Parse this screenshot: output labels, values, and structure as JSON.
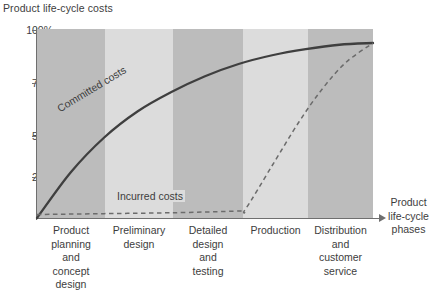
{
  "chart_data": {
    "type": "line",
    "title": "Product life-cycle costs",
    "xlabel": "Product life-cycle phases",
    "ylabel": "",
    "grid": false,
    "legend_position": "inline-annotations",
    "ylim": [
      0,
      108
    ],
    "ytick_labels": [
      "100%",
      "75%",
      "50%",
      "25%"
    ],
    "ytick_values": [
      100,
      75,
      50,
      25
    ],
    "categories": [
      "Product planning and concept design",
      "Preliminary design",
      "Detailed design and testing",
      "Production",
      "Distribution and customer service"
    ],
    "category_lines": [
      [
        "Product",
        "planning",
        "and",
        "concept",
        "design"
      ],
      [
        "Preliminary",
        "design"
      ],
      [
        "Detailed",
        "design",
        "and",
        "testing"
      ],
      [
        "Production"
      ],
      [
        "Distribution",
        "and",
        "customer",
        "service"
      ]
    ],
    "series": [
      {
        "name": "Committed costs",
        "style": "solid",
        "color": "#3f3f3f",
        "x": [
          0,
          10,
          20,
          30,
          40,
          50,
          60,
          70,
          80,
          90,
          100
        ],
        "values": [
          0,
          26,
          46,
          61,
          72,
          81,
          88,
          93,
          96.5,
          99,
          100
        ]
      },
      {
        "name": "Incurred costs",
        "style": "dashed",
        "color": "#6b6b6b",
        "x": [
          0,
          20,
          40,
          60,
          62,
          70,
          78,
          85,
          92,
          100
        ],
        "values": [
          2,
          2.5,
          3,
          4,
          5,
          30,
          55,
          74,
          89,
          100
        ]
      }
    ],
    "annotations": [
      {
        "text": "Committed costs",
        "series": "Committed costs"
      },
      {
        "text": "Incurred costs",
        "series": "Incurred costs"
      }
    ],
    "band_colors": {
      "dark": "#bcbcbc",
      "light": "#dcdcdc"
    },
    "band_pattern": [
      "dark",
      "light",
      "dark",
      "light",
      "dark"
    ]
  }
}
